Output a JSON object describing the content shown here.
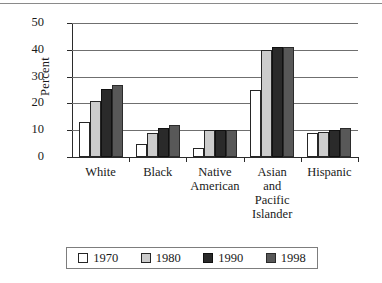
{
  "chart_data": {
    "type": "bar",
    "title": "",
    "subtitle": "",
    "xlabel": "",
    "ylabel": "Percent",
    "ylim": [
      0,
      50
    ],
    "yticks": [
      0,
      10,
      20,
      30,
      40,
      50
    ],
    "ytick_labels": [
      "0",
      "10",
      "20",
      "30",
      "40",
      "50"
    ],
    "grid": true,
    "grid_axis": "y",
    "legend_position": "bottom",
    "categories": [
      "White",
      "Black",
      "Native\nAmerican",
      "Asian\nand\nPacific\nIslander",
      "Hispanic"
    ],
    "series": [
      {
        "name": "1970",
        "color": "#ffffff",
        "values": [
          13,
          5,
          3.5,
          25,
          9
        ]
      },
      {
        "name": "1980",
        "color": "#cccccc",
        "values": [
          21,
          9,
          10,
          40,
          9.5
        ]
      },
      {
        "name": "1990",
        "color": "#2a2a2a",
        "values": [
          25.5,
          11,
          10,
          41,
          10
        ]
      },
      {
        "name": "1998",
        "color": "#585858",
        "values": [
          27,
          12,
          10,
          41,
          11
        ]
      }
    ]
  },
  "legend": {
    "entries": [
      {
        "label": "1970"
      },
      {
        "label": "1980"
      },
      {
        "label": "1990"
      },
      {
        "label": "1998"
      }
    ]
  }
}
